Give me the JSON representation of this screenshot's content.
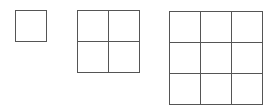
{
  "diagram": {
    "grids": [
      {
        "label": "1x1",
        "rows": 1,
        "cols": 1,
        "x": 15,
        "y": 10,
        "cell": 31
      },
      {
        "label": "2x2",
        "rows": 2,
        "cols": 2,
        "x": 77,
        "y": 10,
        "cell": 31
      },
      {
        "label": "3x3",
        "rows": 3,
        "cols": 3,
        "x": 169,
        "y": 11,
        "cell": 31
      }
    ],
    "line_color": "#555555"
  }
}
